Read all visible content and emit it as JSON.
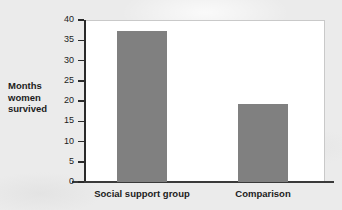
{
  "chart_data": {
    "type": "bar",
    "title": "",
    "xlabel": "",
    "ylabel": "Months women survived",
    "ylabel_lines": [
      "Months",
      "women",
      "survived"
    ],
    "categories": [
      "Social support group",
      "Comparison"
    ],
    "values": [
      37.3,
      19.3
    ],
    "ylim": [
      0,
      40
    ],
    "yticks": [
      0,
      5,
      10,
      15,
      20,
      25,
      30,
      35,
      40
    ],
    "ytick_labels": [
      "0",
      "5",
      "10",
      "15",
      "20",
      "25",
      "30",
      "35",
      "40"
    ],
    "grid": false,
    "legend": false,
    "bar_color": "#808080",
    "plot_background": "#ffffff",
    "page_background": "#ebebeb",
    "axis_color": "#2b2b2b"
  }
}
